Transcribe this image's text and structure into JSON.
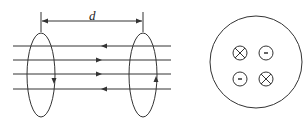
{
  "figure": {
    "left_panel": {
      "distance_label": "d",
      "coils": 2,
      "field_lines": 4,
      "field_line_directions": [
        "left",
        "right",
        "right",
        "left"
      ],
      "left_coil_current_arrow": "down",
      "right_coil_current_arrow": "up"
    },
    "right_panel": {
      "symbols": [
        {
          "position": "top-left",
          "type": "cross",
          "meaning": "into-page"
        },
        {
          "position": "top-right",
          "type": "dot",
          "meaning": "out-of-page"
        },
        {
          "position": "bottom-left",
          "type": "dot",
          "meaning": "out-of-page"
        },
        {
          "position": "bottom-right",
          "type": "cross",
          "meaning": "into-page"
        }
      ]
    },
    "stroke_color": "#333333"
  }
}
